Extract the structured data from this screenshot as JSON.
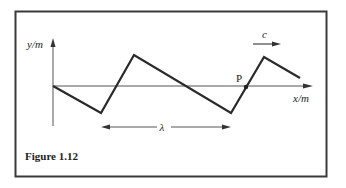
{
  "figure": {
    "caption": "Figure 1.12",
    "y_axis_label": "y/m",
    "x_axis_label": "x/m",
    "point_label": "P",
    "wavelength_label": "λ",
    "speed_label": "c",
    "colors": {
      "frame": "#3a3a3a",
      "wave": "#2a2a2a",
      "axis": "#555555",
      "text": "#222222",
      "background": "#ffffff"
    },
    "wave_points": [
      [
        53,
        86
      ],
      [
        101,
        113
      ],
      [
        134,
        55
      ],
      [
        231,
        113
      ],
      [
        264,
        57
      ],
      [
        300,
        78
      ]
    ]
  }
}
